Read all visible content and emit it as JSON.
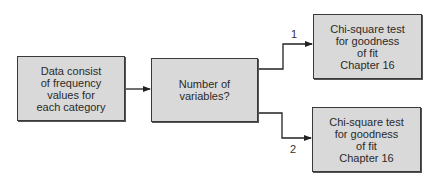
{
  "diagram": {
    "type": "flowchart",
    "nodes": [
      {
        "id": "start",
        "lines": [
          "Data consist",
          "of frequency",
          "values for",
          "each category"
        ]
      },
      {
        "id": "decision",
        "lines": [
          "Number of",
          "variables?"
        ]
      },
      {
        "id": "result_1",
        "lines": [
          "Chi-square test",
          "for goodness",
          "of fit",
          "Chapter 16"
        ]
      },
      {
        "id": "result_2",
        "lines": [
          "Chi-square test",
          "for goodness",
          "of fit",
          "Chapter 16"
        ]
      }
    ],
    "edges": [
      {
        "from": "start",
        "to": "decision",
        "label": ""
      },
      {
        "from": "decision",
        "to": "result_1",
        "label": "1"
      },
      {
        "from": "decision",
        "to": "result_2",
        "label": "2"
      }
    ],
    "colors": {
      "box_fill": "#d9d9d9",
      "box_border": "#3a3a3a",
      "line": "#222222",
      "text": "#2a2a2a"
    }
  }
}
